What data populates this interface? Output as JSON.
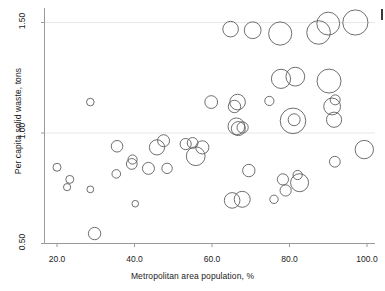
{
  "figure": {
    "background": "#ffffff",
    "ink_color": "#555555",
    "axis_color": "#9a9a9a",
    "text_color": "#1a1a1a",
    "edge_mark_color": "#3a3a3a"
  },
  "axes": {
    "x_title": "Metropolitan area population, %",
    "y_title": "Per capita solid waste, tons",
    "x_ticks": [
      "20.0",
      "40.0",
      "60.0",
      "80.0",
      "100.0"
    ],
    "y_ticks": [
      "1.50",
      "1.00",
      "0.50"
    ]
  },
  "chart_data": {
    "type": "scatter",
    "title": "",
    "xlabel": "Metropolitan area population, %",
    "ylabel": "Per capita solid waste, tons",
    "xlim": [
      17.0,
      103.0
    ],
    "ylim": [
      0.47,
      1.58
    ],
    "xticks": [
      20.0,
      40.0,
      60.0,
      80.0,
      100.0
    ],
    "yticks": [
      0.5,
      1.0,
      1.5
    ],
    "grid": "horizontal-faint",
    "legend": "none",
    "marker": "open-circle",
    "size_encodes": "third variable (bubble area)",
    "points": [
      {
        "x": 20.0,
        "y": 0.845,
        "r": 4.0
      },
      {
        "x": 23.3,
        "y": 0.79,
        "r": 4.0
      },
      {
        "x": 22.6,
        "y": 0.755,
        "r": 3.6
      },
      {
        "x": 28.6,
        "y": 1.14,
        "r": 3.8
      },
      {
        "x": 28.6,
        "y": 0.745,
        "r": 3.4
      },
      {
        "x": 29.7,
        "y": 0.545,
        "r": 6.2
      },
      {
        "x": 35.5,
        "y": 0.94,
        "r": 5.8
      },
      {
        "x": 35.3,
        "y": 0.815,
        "r": 4.3
      },
      {
        "x": 39.5,
        "y": 0.88,
        "r": 4.6
      },
      {
        "x": 39.3,
        "y": 0.86,
        "r": 5.4
      },
      {
        "x": 40.2,
        "y": 0.68,
        "r": 3.3
      },
      {
        "x": 43.6,
        "y": 0.84,
        "r": 6.0
      },
      {
        "x": 45.8,
        "y": 0.935,
        "r": 7.6
      },
      {
        "x": 47.5,
        "y": 0.965,
        "r": 6.0
      },
      {
        "x": 48.4,
        "y": 0.84,
        "r": 5.2
      },
      {
        "x": 53.2,
        "y": 0.95,
        "r": 5.6
      },
      {
        "x": 55.0,
        "y": 0.955,
        "r": 5.4
      },
      {
        "x": 55.8,
        "y": 0.895,
        "r": 9.4
      },
      {
        "x": 57.5,
        "y": 0.935,
        "r": 6.6
      },
      {
        "x": 59.8,
        "y": 1.14,
        "r": 6.4
      },
      {
        "x": 64.8,
        "y": 1.47,
        "r": 7.8
      },
      {
        "x": 65.8,
        "y": 1.12,
        "r": 6.2
      },
      {
        "x": 66.6,
        "y": 1.14,
        "r": 7.8
      },
      {
        "x": 66.3,
        "y": 1.03,
        "r": 8.4
      },
      {
        "x": 66.8,
        "y": 1.02,
        "r": 7.0
      },
      {
        "x": 67.9,
        "y": 1.025,
        "r": 5.6
      },
      {
        "x": 65.2,
        "y": 0.695,
        "r": 7.8
      },
      {
        "x": 67.8,
        "y": 0.7,
        "r": 8.0
      },
      {
        "x": 69.5,
        "y": 0.83,
        "r": 6.2
      },
      {
        "x": 70.5,
        "y": 1.465,
        "r": 8.4
      },
      {
        "x": 74.8,
        "y": 1.145,
        "r": 4.6
      },
      {
        "x": 76.0,
        "y": 0.7,
        "r": 4.2
      },
      {
        "x": 77.6,
        "y": 1.45,
        "r": 11.6
      },
      {
        "x": 77.8,
        "y": 1.245,
        "r": 9.6
      },
      {
        "x": 78.3,
        "y": 0.79,
        "r": 5.6
      },
      {
        "x": 79.0,
        "y": 0.74,
        "r": 5.6
      },
      {
        "x": 80.9,
        "y": 1.055,
        "r": 12.8
      },
      {
        "x": 81.2,
        "y": 1.06,
        "r": 6.0
      },
      {
        "x": 81.5,
        "y": 1.255,
        "r": 9.4
      },
      {
        "x": 82.1,
        "y": 0.81,
        "r": 4.6
      },
      {
        "x": 82.6,
        "y": 0.775,
        "r": 9.0
      },
      {
        "x": 87.5,
        "y": 1.455,
        "r": 11.8
      },
      {
        "x": 90.0,
        "y": 1.495,
        "r": 11.4
      },
      {
        "x": 90.2,
        "y": 1.235,
        "r": 12.0
      },
      {
        "x": 91.0,
        "y": 1.12,
        "r": 8.4
      },
      {
        "x": 91.8,
        "y": 1.15,
        "r": 5.0
      },
      {
        "x": 91.5,
        "y": 1.06,
        "r": 7.6
      },
      {
        "x": 91.7,
        "y": 0.87,
        "r": 5.4
      },
      {
        "x": 97.0,
        "y": 1.5,
        "r": 12.6
      },
      {
        "x": 99.3,
        "y": 0.925,
        "r": 9.2
      }
    ]
  }
}
